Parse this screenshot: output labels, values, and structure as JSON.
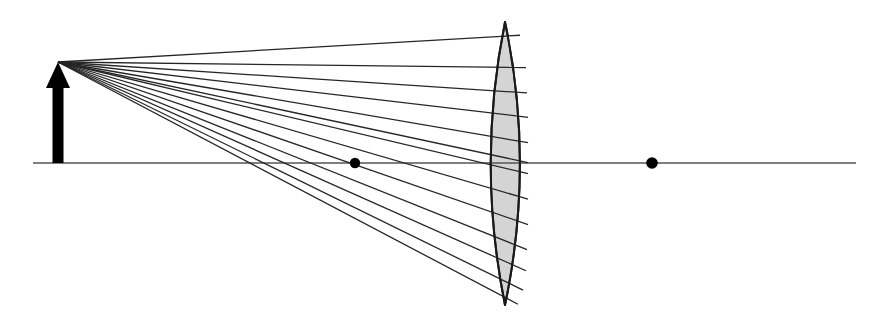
{
  "figure": {
    "canvas": {
      "width": 879,
      "height": 327,
      "background": "#ffffff"
    }
  },
  "colors": {
    "stroke": "#1a1a1a",
    "ray": "#262626",
    "axis": "#555555",
    "lens_fill": "#d4d4d4",
    "lens_outline": "#1a1a1a",
    "object": "#000000",
    "point": "#000000"
  },
  "optical_axis": {
    "label": "optical axis",
    "y": 163,
    "x_start": 33,
    "x_end": 856,
    "stroke_width": 1.4
  },
  "object": {
    "label": "object arrow",
    "x": 58,
    "tip_y": 62,
    "base_y": 163,
    "shaft_width": 11,
    "head_half_width": 12,
    "head_height": 26,
    "height_px": 101
  },
  "lens": {
    "label": "biconvex converging lens",
    "type": "biconvex",
    "center_x": 505,
    "top_apex": {
      "x": 505,
      "y": 22
    },
    "bottom_apex": {
      "x": 505,
      "y": 305
    },
    "left_vertex_x": 483,
    "right_vertex_x": 526,
    "aperture_height": 283,
    "outline_width": 2.0,
    "fill": "#d4d4d4"
  },
  "axis_points": [
    {
      "name": "near-focal-point",
      "x": 355,
      "y": 163,
      "radius": 5.2
    },
    {
      "name": "far-focal-point",
      "x": 652,
      "y": 163,
      "radius": 5.8
    }
  ],
  "ray_fan": {
    "label": "incident ray fan",
    "source": {
      "x": 58,
      "y": 62
    },
    "count": 13,
    "stroke_width": 1.3,
    "rays": [
      {
        "id": 1,
        "entry_y": 37,
        "entry_x": 490,
        "stop_x": 520
      },
      {
        "id": 2,
        "entry_y": 67,
        "entry_x": 484,
        "stop_x": 526
      },
      {
        "id": 3,
        "entry_y": 90,
        "entry_x": 483,
        "stop_x": 527
      },
      {
        "id": 4,
        "entry_y": 112,
        "entry_x": 483,
        "stop_x": 528
      },
      {
        "id": 5,
        "entry_y": 135,
        "entry_x": 483,
        "stop_x": 528
      },
      {
        "id": 6,
        "entry_y": 153,
        "entry_x": 483,
        "stop_x": 528
      },
      {
        "id": 7,
        "entry_y": 163,
        "entry_x": 483,
        "stop_x": 528
      },
      {
        "id": 8,
        "entry_y": 186,
        "entry_x": 483,
        "stop_x": 528
      },
      {
        "id": 9,
        "entry_y": 209,
        "entry_x": 483,
        "stop_x": 528
      },
      {
        "id": 10,
        "entry_y": 232,
        "entry_x": 483,
        "stop_x": 527
      },
      {
        "id": 11,
        "entry_y": 252,
        "entry_x": 484,
        "stop_x": 526
      },
      {
        "id": 12,
        "entry_y": 272,
        "entry_x": 486,
        "stop_x": 523
      },
      {
        "id": 13,
        "entry_y": 290,
        "entry_x": 491,
        "stop_x": 518
      }
    ]
  }
}
